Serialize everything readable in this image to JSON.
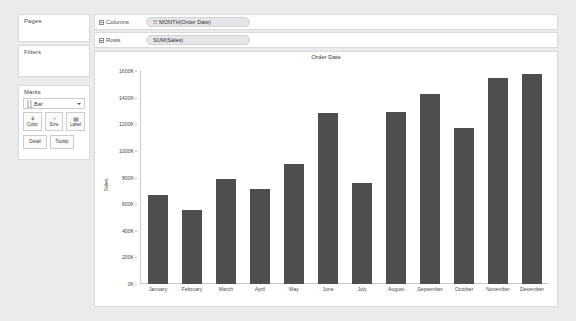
{
  "app": {
    "name": "Tableau Desktop Worksheet"
  },
  "left_rail": {
    "pages": {
      "title": "Pages"
    },
    "filters": {
      "title": "Filters"
    },
    "marks": {
      "title": "Marks",
      "mark_type": "Bar",
      "mark_type_icon": "bar-chart-icon",
      "caret_icon": "chevron-down-icon",
      "buttons": [
        {
          "label": "Color",
          "icon": "color-palette-icon",
          "glyph": "⚘"
        },
        {
          "label": "Size",
          "icon": "size-icon",
          "glyph": "◔"
        },
        {
          "label": "Label",
          "icon": "label-icon",
          "glyph": "▤"
        }
      ],
      "buttons_lower": [
        {
          "label": "Detail",
          "icon": "detail-icon"
        },
        {
          "label": "Tooltip",
          "icon": "tooltip-icon"
        }
      ]
    }
  },
  "shelves": {
    "columns": {
      "label": "Columns",
      "icon": "columns-grid-icon",
      "pill": {
        "text": "MONTH(Order Date)",
        "icon": "calendar-pill-icon",
        "glyph": "☷"
      }
    },
    "rows": {
      "label": "Rows",
      "icon": "rows-grid-icon",
      "pill": {
        "text": "SUM(Sales)",
        "icon": "measure-pill-icon",
        "glyph": ""
      }
    }
  },
  "colors": {
    "bar": "#4e4e4e",
    "canvas": "#ffffff",
    "app_background": "#e9ebed",
    "panel_border": "#d8dbde",
    "pill_background": "#e4e6e9",
    "axis_line": "#c6c9cc",
    "text": "#4a4a4a"
  },
  "chart_data": {
    "type": "bar",
    "title": "Order Date",
    "xlabel": "",
    "ylabel": "Sales",
    "ylim": [
      0,
      1600000
    ],
    "grid": false,
    "legend": "none",
    "categories": [
      "January",
      "February",
      "March",
      "April",
      "May",
      "June",
      "July",
      "August",
      "September",
      "October",
      "November",
      "December"
    ],
    "values": [
      665000,
      558000,
      789000,
      710000,
      898000,
      1281000,
      760000,
      1289000,
      1426000,
      1173000,
      1549000,
      1578000
    ],
    "y_ticks": [
      {
        "value": 0,
        "label": "0K"
      },
      {
        "value": 200000,
        "label": "200K"
      },
      {
        "value": 400000,
        "label": "400K"
      },
      {
        "value": 600000,
        "label": "600K"
      },
      {
        "value": 800000,
        "label": "800K"
      },
      {
        "value": 1000000,
        "label": "1000K"
      },
      {
        "value": 1200000,
        "label": "1200K"
      },
      {
        "value": 1400000,
        "label": "1400K"
      },
      {
        "value": 1600000,
        "label": "1600K"
      }
    ],
    "series": [
      {
        "name": "SUM(Sales)",
        "values": [
          665000,
          558000,
          789000,
          710000,
          898000,
          1281000,
          760000,
          1289000,
          1426000,
          1173000,
          1549000,
          1578000
        ]
      }
    ]
  }
}
